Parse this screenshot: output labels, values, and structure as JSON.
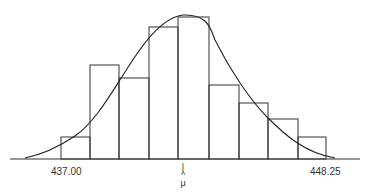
{
  "chart_data": {
    "type": "bar",
    "title": "",
    "xlabel": "",
    "ylabel": "",
    "categories": [
      "b1",
      "b2",
      "b3",
      "b4",
      "b5",
      "b6",
      "b7",
      "b8",
      "b9"
    ],
    "values": [
      22,
      94,
      81,
      132,
      142,
      74,
      56,
      40,
      22
    ],
    "x_tick_labels": {
      "left": "437.00",
      "right": "448.25"
    },
    "mean_marker": "μ̂",
    "series": [
      {
        "name": "histogram",
        "values": [
          22,
          94,
          81,
          132,
          142,
          74,
          56,
          40,
          22
        ]
      },
      {
        "name": "normal-curve",
        "peak_at": "μ̂"
      }
    ],
    "grid": false,
    "legend": "none"
  },
  "labels": {
    "left": "437.00",
    "right": "448.25",
    "mu_bar": "|",
    "mu_hat": "^",
    "mu": "μ"
  }
}
